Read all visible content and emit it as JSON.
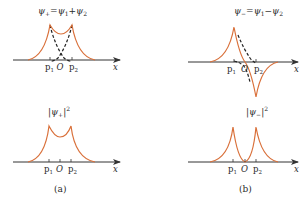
{
  "panels": {
    "a": {
      "caption": "(a)",
      "top": {
        "title": "ψ+=ψ1+ψ2",
        "title_parts": {
          "lhs": "ψ",
          "lhs_sub": "+",
          "eq": "=",
          "t1": "ψ",
          "t1_sub": "1",
          "op": "+",
          "t2": "ψ",
          "t2_sub": "2"
        },
        "axis_label": "x",
        "ticks": {
          "p1": "p",
          "p1_sub": "1",
          "o": "O",
          "p2": "p",
          "p2_sub": "2"
        }
      },
      "bottom": {
        "title": "|ψ+|²",
        "title_parts": {
          "bar_l": "|",
          "psi": "ψ",
          "sub": "+",
          "bar_r": "|",
          "sup": "2"
        },
        "axis_label": "x",
        "ticks": {
          "p1": "p",
          "p1_sub": "1",
          "o": "O",
          "p2": "p",
          "p2_sub": "2"
        }
      }
    },
    "b": {
      "caption": "(b)",
      "top": {
        "title": "ψ−=ψ1−ψ2",
        "title_parts": {
          "lhs": "ψ",
          "lhs_sub": "−",
          "eq": "=",
          "t1": "ψ",
          "t1_sub": "1",
          "op": "−",
          "t2": "ψ",
          "t2_sub": "2"
        },
        "axis_label": "x",
        "ticks": {
          "p1": "p",
          "p1_sub": "1",
          "o": "O",
          "p2": "p",
          "p2_sub": "2"
        }
      },
      "bottom": {
        "title": "|ψ−|²",
        "title_parts": {
          "bar_l": "|",
          "psi": "ψ",
          "sub": "−",
          "bar_r": "|",
          "sup": "2"
        },
        "axis_label": "x",
        "ticks": {
          "p1": "p",
          "p1_sub": "1",
          "o": "O",
          "p2": "p",
          "p2_sub": "2"
        }
      }
    }
  },
  "colors": {
    "curve": "#d9703a",
    "axis": "#333333",
    "dashed": "#222222"
  }
}
